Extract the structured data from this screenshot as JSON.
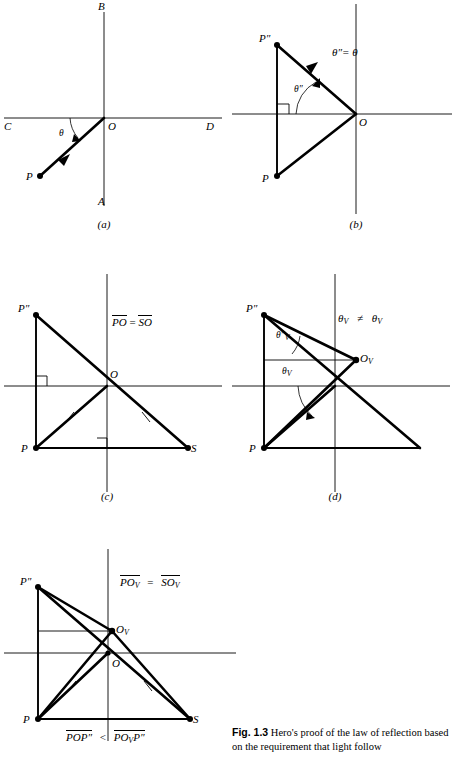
{
  "figure": {
    "number": "Fig. 1.3",
    "caption_text": "Hero's proof of the law of reflection based on the requirement that light follow"
  },
  "panels": [
    {
      "id": "a",
      "label": "(a)",
      "points": [
        "B",
        "C",
        "O",
        "D",
        "A",
        "P"
      ],
      "angle_labels": [
        "θ"
      ],
      "annotation": ""
    },
    {
      "id": "b",
      "label": "(b)",
      "points": [
        "P″",
        "P",
        "O"
      ],
      "angle_labels": [
        "θ″"
      ],
      "annotation": "θ″= θ"
    },
    {
      "id": "c",
      "label": "(c)",
      "points": [
        "P″",
        "O",
        "P",
        "S"
      ],
      "angle_labels": [],
      "annotation_left": "PO",
      "annotation_op": "=",
      "annotation_right": "SO"
    },
    {
      "id": "d",
      "label": "(d)",
      "points": [
        "P″",
        "O",
        "P"
      ],
      "angle_labels": [
        "θ",
        "θ"
      ],
      "annotation": "≠"
    },
    {
      "id": "e",
      "label": "",
      "points": [
        "P″",
        "O",
        "P",
        "S"
      ],
      "annotation_left": "PO",
      "annotation_op": "=",
      "annotation_right": "SO"
    }
  ],
  "labels": {
    "B": "B",
    "A": "A",
    "C": "C",
    "D": "D",
    "O": "O",
    "P": "P",
    "S": "S",
    "P_dprime": "P″",
    "O_sub_V": "O",
    "theta": "θ",
    "theta_dprime": "θ″",
    "sub_V": "V",
    "panel_a": "(a)",
    "panel_b": "(b)",
    "panel_c": "(c)",
    "panel_d": "(d)"
  },
  "annotations": {
    "b_theta_eq": "θ″=  θ",
    "c_left": "PO",
    "c_op": "=",
    "c_right": "SO",
    "d_left_theta": "θ",
    "d_neq": "≠",
    "d_right_theta": "θ",
    "e_left": "PO",
    "e_op": "=",
    "e_right": "SO",
    "e_bottom_left": "POP″",
    "e_bottom_op": "<",
    "e_bottom_right": "PO",
    "e_bottom_right_tail": "P″"
  },
  "colors": {
    "ink": "#000000",
    "background": "#ffffff"
  }
}
